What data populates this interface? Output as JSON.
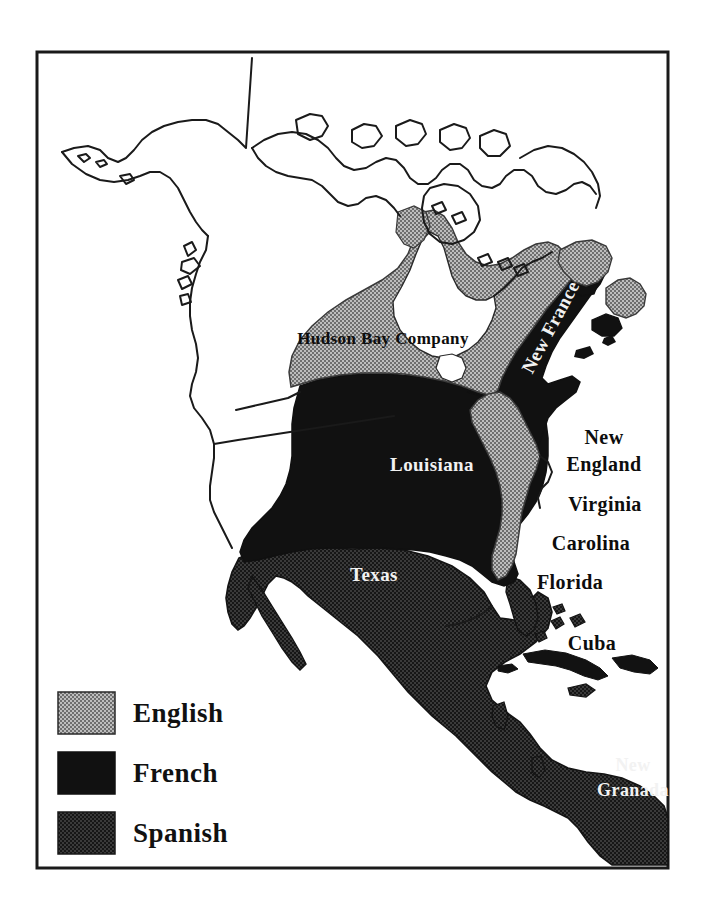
{
  "figure": {
    "kind": "historical-map",
    "title_visible": false,
    "frame": {
      "stroke_color": "#1a1a1a",
      "fill_color": "#ffffff",
      "x": 37,
      "y": 52,
      "width": 631,
      "height": 816
    }
  },
  "legend": {
    "items": [
      {
        "label": "English",
        "swatch": "english-swatch",
        "fill_style": "gray-halftone",
        "color": "#8a8a8a"
      },
      {
        "label": "French",
        "swatch": "french-swatch",
        "fill_style": "solid-black",
        "color": "#141414"
      },
      {
        "label": "Spanish",
        "swatch": "spanish-swatch",
        "fill_style": "dark-stipple",
        "color": "#232323"
      }
    ]
  },
  "territories": [
    {
      "name": "Hudson Bay Company",
      "power": "English",
      "label": "Hudson Bay Company",
      "label_color": "#0d0d0d",
      "font_size": 17,
      "x": 383,
      "y": 344,
      "rotation": 0
    },
    {
      "name": "New France",
      "power": "French",
      "label": "New France",
      "label_color": "#f2f2f2",
      "font_size": 19,
      "x": 556,
      "y": 330,
      "rotation": -62
    },
    {
      "name": "Louisiana",
      "power": "French",
      "label": "Louisiana",
      "label_color": "#f2f2f2",
      "font_size": 19,
      "x": 432,
      "y": 471,
      "rotation": 0
    },
    {
      "name": "New England",
      "power": "English",
      "label": "New England",
      "label_color": "#0d0d0d",
      "font_size": 20,
      "x": 604,
      "y": 444,
      "rotation": 0
    },
    {
      "name": "Virginia",
      "power": "English",
      "label": "Virginia",
      "label_color": "#0d0d0d",
      "font_size": 20,
      "x": 605,
      "y": 511,
      "rotation": 0
    },
    {
      "name": "Carolina",
      "power": "English",
      "label": "Carolina",
      "label_color": "#0d0d0d",
      "font_size": 20,
      "x": 591,
      "y": 550,
      "rotation": 0
    },
    {
      "name": "Florida",
      "power": "Spanish",
      "label": "Florida",
      "label_color": "#0d0d0d",
      "font_size": 20,
      "x": 570,
      "y": 589,
      "rotation": 0
    },
    {
      "name": "Cuba",
      "power": "Spanish",
      "label": "Cuba",
      "label_color": "#0d0d0d",
      "font_size": 20,
      "x": 592,
      "y": 650,
      "rotation": 0
    },
    {
      "name": "Texas",
      "power": "Spanish",
      "label": "Texas",
      "label_color": "#f2f2f2",
      "font_size": 19,
      "x": 374,
      "y": 581,
      "rotation": 0
    },
    {
      "name": "New Granada",
      "power": "Spanish",
      "label_line_1": "New",
      "label_line_2": "Granada",
      "label_color": "#f2f2f2",
      "font_size": 18,
      "x": 633,
      "y": 771,
      "rotation": 0
    }
  ],
  "labels": {
    "hudson_bay_company": "Hudson Bay Company",
    "new_france": "New France",
    "louisiana": "Louisiana",
    "new_england_line1": "New",
    "new_england_line2": "England",
    "virginia": "Virginia",
    "carolina": "Carolina",
    "florida": "Florida",
    "cuba": "Cuba",
    "texas": "Texas",
    "new_granada_line1": "New",
    "new_granada_line2": "Granada"
  },
  "legend_labels": {
    "english": "English",
    "french": "French",
    "spanish": "Spanish"
  },
  "colors": {
    "english_gray": "#8c8c8c",
    "french_black": "#121212",
    "spanish_dark": "#1e1e1e",
    "unclaimed_white": "#ffffff",
    "outline": "#1a1a1a",
    "frame": "#1a1a1a"
  }
}
